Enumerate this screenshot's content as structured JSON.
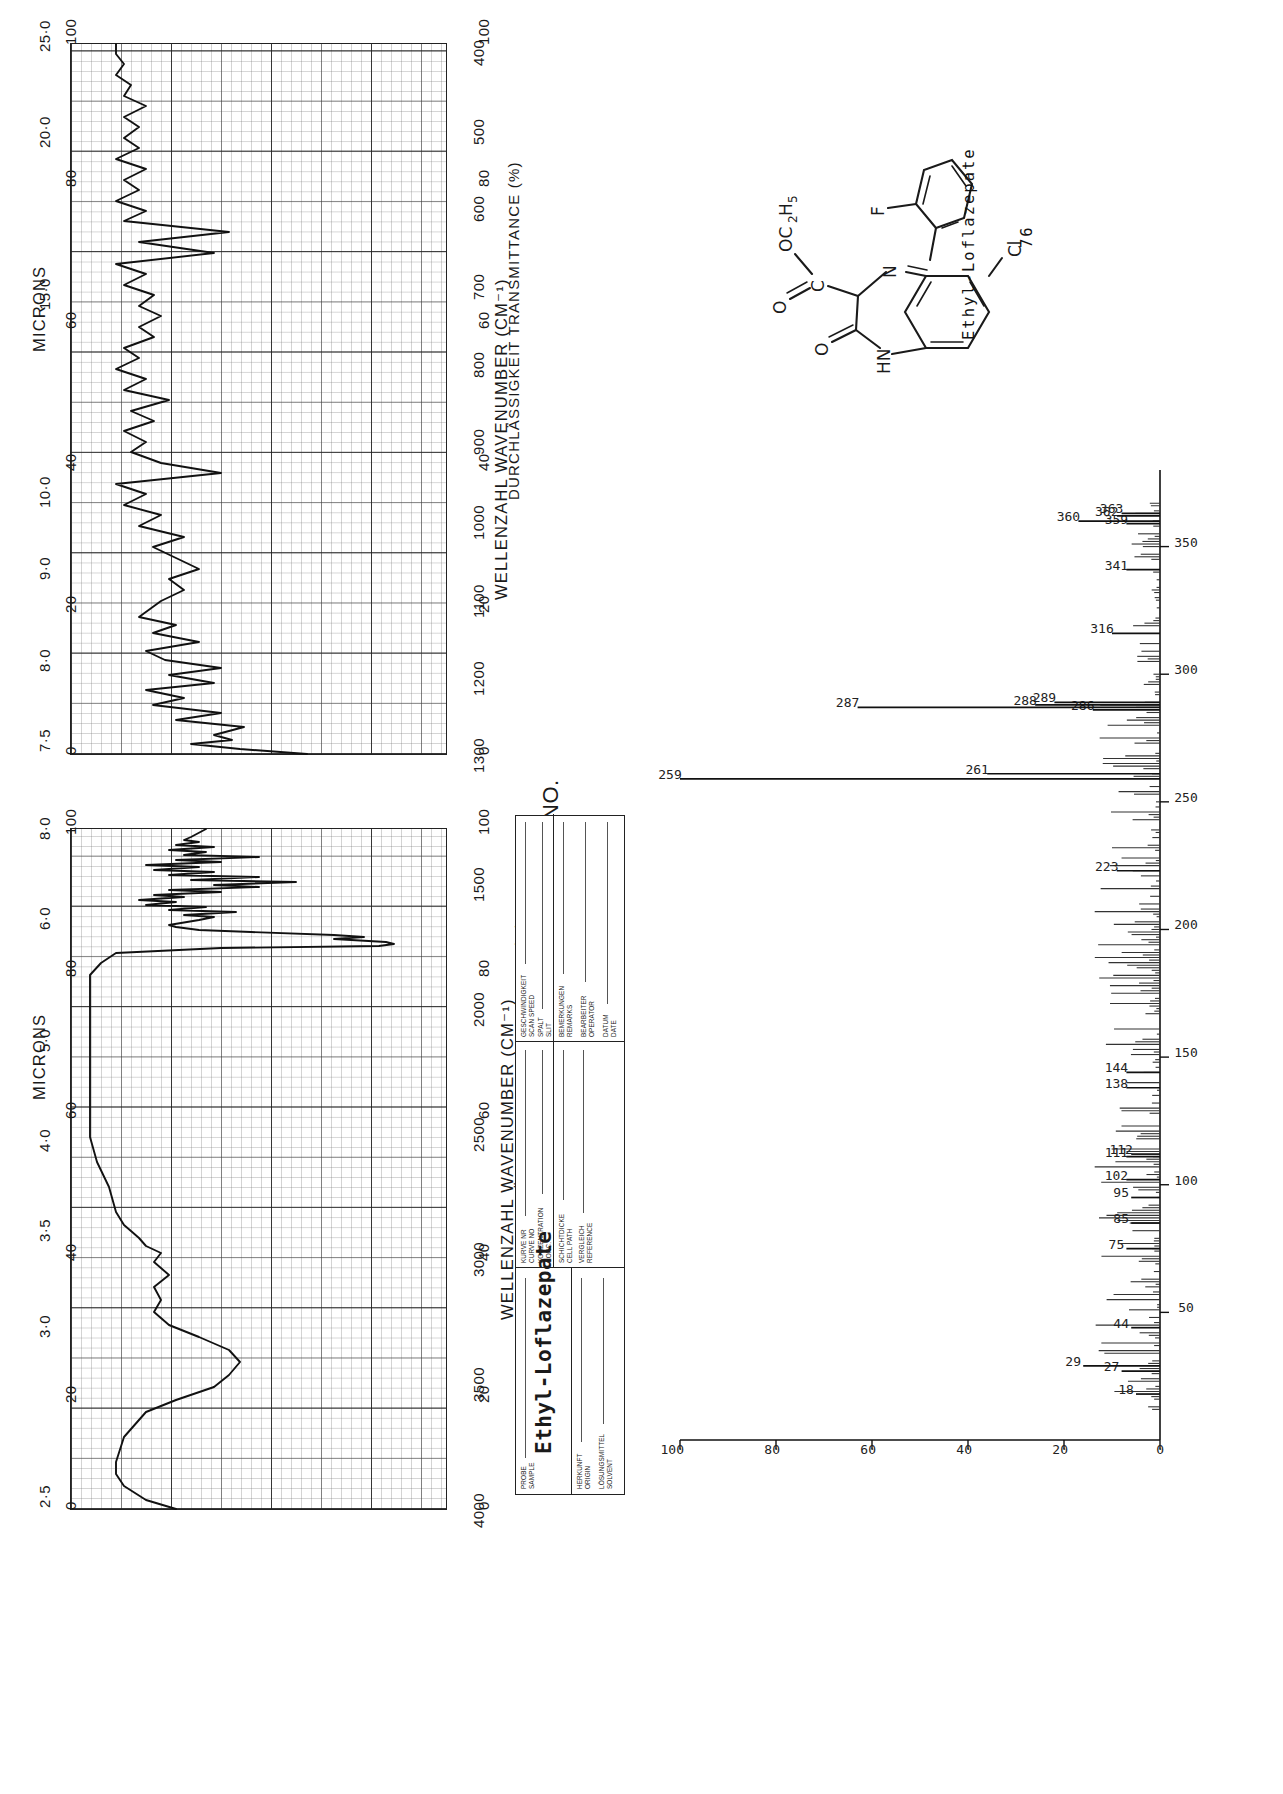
{
  "page": {
    "compound_name": "Ethyl-Loflazepate",
    "compound_number": "76",
    "orientation_note": "landscape content rotated 90 degrees counter-clockwise"
  },
  "form": {
    "no_label": "NO.",
    "sample_title": "Ethyl-Loflazepate",
    "fields": [
      {
        "de": "PROBE",
        "en": "SAMPLE"
      },
      {
        "de": "HERKUNFT",
        "en": "ORIGIN"
      },
      {
        "de": "LÖSUNGSMITTEL",
        "en": "SOLVENT"
      },
      {
        "de": "KURVE NR",
        "en": "CURVE NO"
      },
      {
        "de": "KONZENTRATION",
        "en": "CONC."
      },
      {
        "de": "SCHICHTDICKE",
        "en": "CELL PATH"
      },
      {
        "de": "VERGLEICH",
        "en": "REFERENCE"
      },
      {
        "de": "GESCHWINDIGKEIT",
        "en": "SCAN SPEED"
      },
      {
        "de": "SPALT",
        "en": "SLIT"
      },
      {
        "de": "BEMERKUNGEN",
        "en": "REMARKS"
      },
      {
        "de": "BEARBEITER",
        "en": "OPERATOR"
      },
      {
        "de": "DATUM",
        "en": "DATE"
      }
    ]
  },
  "ir_axis": {
    "y_title": "DURCHLÄSSIGKEIT TRANSMITTANCE (%)",
    "x_title": "WELLENZAHL  WAVENUMBER (CM⁻¹)",
    "microns_label": "MICRONS",
    "transmittance_ticks": [
      100,
      80,
      60,
      40,
      20,
      0
    ]
  },
  "chart_data": [
    {
      "id": "ir-panel-upper",
      "type": "line",
      "title": "IR spectrum 1300-400 cm-1 (MICRONS 7.5-25.0)",
      "xlabel": "WELLENZAHL  WAVENUMBER (CM⁻¹)",
      "ylabel": "DURCHLÄSSIGKEIT TRANSMITTANCE (%)",
      "xlim": [
        1300,
        400
      ],
      "ylim": [
        0,
        100
      ],
      "grid": true,
      "x_ticks": [
        1300,
        1200,
        1100,
        1000,
        900,
        800,
        700,
        600,
        500,
        400
      ],
      "y_ticks": [
        100,
        80,
        60,
        40,
        20,
        0
      ],
      "micron_ticks": [
        7.5,
        8.0,
        9.0,
        10.0,
        15.0,
        20.0,
        25.0
      ],
      "micron_axis_label": "MICRONS",
      "points": [
        [
          1300,
          37
        ],
        [
          1295,
          55
        ],
        [
          1290,
          68
        ],
        [
          1285,
          57
        ],
        [
          1280,
          62
        ],
        [
          1272,
          54
        ],
        [
          1265,
          72
        ],
        [
          1258,
          60
        ],
        [
          1250,
          78
        ],
        [
          1243,
          70
        ],
        [
          1235,
          80
        ],
        [
          1228,
          62
        ],
        [
          1220,
          74
        ],
        [
          1212,
          60
        ],
        [
          1205,
          75
        ],
        [
          1196,
          80
        ],
        [
          1188,
          66
        ],
        [
          1180,
          78
        ],
        [
          1172,
          70
        ],
        [
          1165,
          82
        ],
        [
          1150,
          76
        ],
        [
          1140,
          70
        ],
        [
          1130,
          74
        ],
        [
          1120,
          66
        ],
        [
          1110,
          72
        ],
        [
          1100,
          78
        ],
        [
          1090,
          70
        ],
        [
          1080,
          82
        ],
        [
          1070,
          76
        ],
        [
          1060,
          86
        ],
        [
          1050,
          80
        ],
        [
          1040,
          88
        ],
        [
          1030,
          60
        ],
        [
          1020,
          76
        ],
        [
          1010,
          84
        ],
        [
          1000,
          80
        ],
        [
          990,
          86
        ],
        [
          980,
          78
        ],
        [
          970,
          84
        ],
        [
          960,
          74
        ],
        [
          950,
          86
        ],
        [
          940,
          80
        ],
        [
          930,
          88
        ],
        [
          920,
          82
        ],
        [
          910,
          86
        ],
        [
          900,
          78
        ],
        [
          890,
          84
        ],
        [
          880,
          72
        ],
        [
          870,
          80
        ],
        [
          860,
          74
        ],
        [
          850,
          82
        ],
        [
          840,
          76
        ],
        [
          830,
          86
        ],
        [
          820,
          80
        ],
        [
          810,
          88
        ],
        [
          800,
          62
        ],
        [
          790,
          82
        ],
        [
          780,
          58
        ],
        [
          770,
          86
        ],
        [
          760,
          80
        ],
        [
          750,
          88
        ],
        [
          740,
          82
        ],
        [
          730,
          86
        ],
        [
          720,
          78
        ],
        [
          710,
          86
        ],
        [
          700,
          80
        ],
        [
          690,
          88
        ],
        [
          680,
          82
        ],
        [
          670,
          86
        ],
        [
          660,
          80
        ],
        [
          650,
          88
        ],
        [
          640,
          82
        ],
        [
          630,
          86
        ],
        [
          620,
          84
        ],
        [
          610,
          88
        ],
        [
          600,
          80
        ],
        [
          590,
          86
        ],
        [
          580,
          84
        ],
        [
          570,
          88
        ],
        [
          560,
          86
        ],
        [
          550,
          88
        ],
        [
          540,
          84
        ],
        [
          530,
          88
        ],
        [
          520,
          86
        ],
        [
          510,
          90
        ],
        [
          500,
          88
        ],
        [
          490,
          86
        ],
        [
          480,
          90
        ],
        [
          470,
          88
        ],
        [
          460,
          90
        ],
        [
          450,
          88
        ],
        [
          440,
          88
        ],
        [
          430,
          86
        ],
        [
          420,
          88
        ],
        [
          410,
          86
        ],
        [
          400,
          88
        ]
      ]
    },
    {
      "id": "ir-panel-lower",
      "type": "line",
      "title": "IR spectrum 4000-1300 cm-1 (MICRONS 2.5-8.0)",
      "xlabel": "WELLENZAHL  WAVENUMBER (CM⁻¹)",
      "ylabel": "DURCHLÄSSIGKEIT TRANSMITTANCE (%)",
      "xlim": [
        4000,
        1300
      ],
      "ylim": [
        0,
        100
      ],
      "grid": true,
      "x_ticks": [
        4000,
        3500,
        3000,
        2500,
        2000,
        1500,
        1300
      ],
      "y_ticks": [
        100,
        80,
        60,
        40,
        20,
        0
      ],
      "micron_ticks": [
        2.5,
        3.0,
        3.5,
        4.0,
        5.0,
        6.0,
        8.0
      ],
      "micron_axis_label": "MICRONS",
      "points": [
        [
          4000,
          72
        ],
        [
          3960,
          80
        ],
        [
          3900,
          86
        ],
        [
          3850,
          88
        ],
        [
          3800,
          88
        ],
        [
          3700,
          86
        ],
        [
          3600,
          80
        ],
        [
          3550,
          72
        ],
        [
          3500,
          62
        ],
        [
          3450,
          58
        ],
        [
          3400,
          55
        ],
        [
          3350,
          58
        ],
        [
          3300,
          66
        ],
        [
          3250,
          74
        ],
        [
          3200,
          78
        ],
        [
          3150,
          76
        ],
        [
          3100,
          78
        ],
        [
          3050,
          74
        ],
        [
          3000,
          78
        ],
        [
          2960,
          76
        ],
        [
          2930,
          80
        ],
        [
          2900,
          82
        ],
        [
          2870,
          84
        ],
        [
          2850,
          86
        ],
        [
          2800,
          88
        ],
        [
          2700,
          90
        ],
        [
          2600,
          92
        ],
        [
          2500,
          93
        ],
        [
          2400,
          93
        ],
        [
          2300,
          93
        ],
        [
          2200,
          93
        ],
        [
          2100,
          93
        ],
        [
          2000,
          93
        ],
        [
          1900,
          93
        ],
        [
          1850,
          93
        ],
        [
          1800,
          92
        ],
        [
          1760,
          90
        ],
        [
          1740,
          60
        ],
        [
          1730,
          18
        ],
        [
          1720,
          14
        ],
        [
          1710,
          16
        ],
        [
          1700,
          30
        ],
        [
          1690,
          22
        ],
        [
          1680,
          30
        ],
        [
          1670,
          52
        ],
        [
          1660,
          70
        ],
        [
          1650,
          78
        ],
        [
          1640,
          74
        ],
        [
          1620,
          62
        ],
        [
          1610,
          68
        ],
        [
          1600,
          56
        ],
        [
          1590,
          74
        ],
        [
          1580,
          64
        ],
        [
          1570,
          80
        ],
        [
          1560,
          72
        ],
        [
          1550,
          82
        ],
        [
          1540,
          70
        ],
        [
          1530,
          80
        ],
        [
          1520,
          60
        ],
        [
          1510,
          74
        ],
        [
          1500,
          40
        ],
        [
          1490,
          62
        ],
        [
          1480,
          50
        ],
        [
          1470,
          68
        ],
        [
          1460,
          58
        ],
        [
          1450,
          72
        ],
        [
          1440,
          62
        ],
        [
          1430,
          76
        ],
        [
          1420,
          66
        ],
        [
          1410,
          78
        ],
        [
          1400,
          60
        ],
        [
          1390,
          72
        ],
        [
          1380,
          56
        ],
        [
          1370,
          70
        ],
        [
          1360,
          66
        ],
        [
          1350,
          74
        ],
        [
          1340,
          62
        ],
        [
          1330,
          72
        ],
        [
          1320,
          66
        ],
        [
          1310,
          70
        ],
        [
          1300,
          64
        ]
      ]
    },
    {
      "id": "mass-spectrum",
      "type": "bar",
      "title": "Mass spectrum of Ethyl-Loflazepate",
      "xlabel": "m/z",
      "ylabel": "Relative intensity (%)",
      "xlim": [
        0,
        380
      ],
      "ylim": [
        0,
        100
      ],
      "grid": false,
      "x_ticks": [
        50,
        100,
        150,
        200,
        250,
        300,
        350
      ],
      "y_ticks": [
        0,
        20,
        40,
        60,
        80,
        100
      ],
      "labelled_peaks": [
        {
          "mz": 18,
          "intensity": 5
        },
        {
          "mz": 27,
          "intensity": 8
        },
        {
          "mz": 29,
          "intensity": 16
        },
        {
          "mz": 44,
          "intensity": 6
        },
        {
          "mz": 75,
          "intensity": 7
        },
        {
          "mz": 85,
          "intensity": 6
        },
        {
          "mz": 95,
          "intensity": 6
        },
        {
          "mz": 102,
          "intensity": 7
        },
        {
          "mz": 111,
          "intensity": 7
        },
        {
          "mz": 112,
          "intensity": 6
        },
        {
          "mz": 138,
          "intensity": 7
        },
        {
          "mz": 144,
          "intensity": 7
        },
        {
          "mz": 223,
          "intensity": 9
        },
        {
          "mz": 259,
          "intensity": 100
        },
        {
          "mz": 261,
          "intensity": 36
        },
        {
          "mz": 286,
          "intensity": 14
        },
        {
          "mz": 287,
          "intensity": 63
        },
        {
          "mz": 288,
          "intensity": 26
        },
        {
          "mz": 289,
          "intensity": 22
        },
        {
          "mz": 316,
          "intensity": 10
        },
        {
          "mz": 341,
          "intensity": 7
        },
        {
          "mz": 359,
          "intensity": 7
        },
        {
          "mz": 360,
          "intensity": 17
        },
        {
          "mz": 362,
          "intensity": 9
        },
        {
          "mz": 363,
          "intensity": 8
        }
      ],
      "base_peak_mz": 259,
      "molecular_ion_mz": 360
    }
  ]
}
